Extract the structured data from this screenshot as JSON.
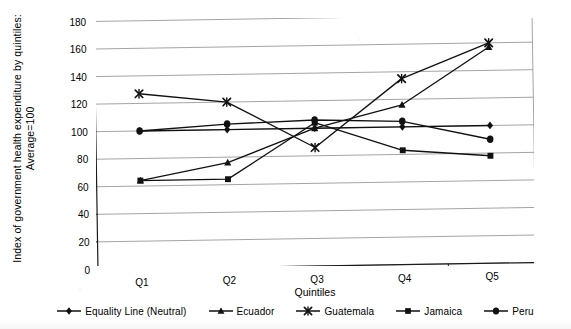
{
  "chart_data": {
    "type": "line",
    "title": "",
    "xlabel": "Quintiles",
    "ylabel": "Index of government health expenditure by quintiles: Average=100",
    "ylabel_line1": "Index of government health expenditure by quintiles:",
    "ylabel_line2": "Average=100",
    "categories": [
      "Q1",
      "Q2",
      "Q3",
      "Q4",
      "Q5"
    ],
    "ylim": [
      0,
      180
    ],
    "yticks": [
      0,
      20,
      40,
      60,
      80,
      100,
      120,
      140,
      160,
      180
    ],
    "grid": true,
    "legend_position": "bottom",
    "series": [
      {
        "name": "Equality Line (Neutral)",
        "marker": "diamond",
        "values": [
          100,
          100,
          100,
          100,
          100
        ]
      },
      {
        "name": "Ecuador",
        "marker": "triangle",
        "values": [
          64,
          76,
          100,
          116,
          157
        ]
      },
      {
        "name": "Guatemala",
        "marker": "x",
        "values": [
          127,
          120,
          86,
          135,
          160
        ]
      },
      {
        "name": "Jamaica",
        "marker": "square",
        "values": [
          64,
          64,
          104,
          83,
          78
        ]
      },
      {
        "name": "Peru",
        "marker": "circle",
        "values": [
          100,
          104,
          106,
          104,
          90
        ]
      }
    ]
  },
  "legend": {
    "items": [
      {
        "label": "Equality Line (Neutral)",
        "marker": "diamond"
      },
      {
        "label": "Ecuador",
        "marker": "triangle"
      },
      {
        "label": "Guatemala",
        "marker": "x"
      },
      {
        "label": "Jamaica",
        "marker": "square"
      },
      {
        "label": "Peru",
        "marker": "circle"
      }
    ]
  },
  "colors": {
    "ink": "#111111",
    "grid": "#8d8d8d",
    "axis": "#1a1a1a",
    "background": "#ffffff"
  }
}
